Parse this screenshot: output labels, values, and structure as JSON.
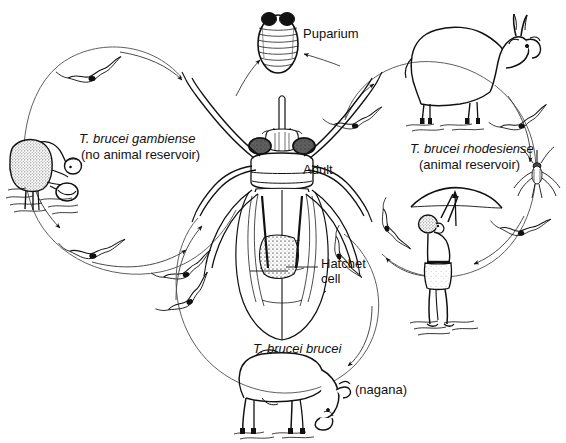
{
  "figure": {
    "kind": "life-cycle-diagram",
    "background_color": "#ffffff",
    "ink_color": "#111111"
  },
  "labels": {
    "puparium": "Puparium",
    "adult": "Adult",
    "hatchet_cell": "Hatchet\ncell",
    "gambiense_name": "T. brucei gambiense",
    "gambiense_note": "(no animal reservoir)",
    "rhodesiense_name": "T. brucei rhodesiense",
    "rhodesiense_note": "(animal reservoir)",
    "brucei_name": "T. brucei brucei",
    "brucei_note": "(nagana)"
  },
  "organisms": [
    {
      "name": "tsetse-fly-adult",
      "role": "vector, central illustration"
    },
    {
      "name": "tsetse-puparium",
      "role": "pupal stage, top center"
    },
    {
      "name": "human-bending-over-water",
      "role": "host, gambiense cycle, left"
    },
    {
      "name": "human-with-bow-and-arrow",
      "role": "host, rhodesiense cycle, right"
    },
    {
      "name": "antelope-bushbuck",
      "role": "animal reservoir, rhodesiense cycle, top right"
    },
    {
      "name": "cattle-zebu-grazing",
      "role": "animal host, brucei/nagana cycle, bottom"
    },
    {
      "name": "tsetse-fly-small",
      "role": "vector, right cycle"
    },
    {
      "name": "trypanosome",
      "role": "parasite, drawn as wavy flagellate with dark kinetoplast"
    }
  ],
  "cycles": [
    {
      "id": "gambiense",
      "title": "T. brucei gambiense",
      "note": "(no animal reservoir)",
      "hosts": [
        "human-bending-over-water"
      ]
    },
    {
      "id": "rhodesiense",
      "title": "T. brucei rhodesiense",
      "note": "(animal reservoir)",
      "hosts": [
        "antelope-bushbuck",
        "human-with-bow-and-arrow"
      ]
    },
    {
      "id": "brucei",
      "title": "T. brucei brucei",
      "note": "(nagana)",
      "hosts": [
        "cattle-zebu-grazing"
      ]
    }
  ],
  "callouts": [
    {
      "name": "puparium-callout",
      "text": "Puparium"
    },
    {
      "name": "adult-callout",
      "text": "Adult"
    },
    {
      "name": "hatchet-cell-callout",
      "text": "Hatchet cell"
    }
  ]
}
